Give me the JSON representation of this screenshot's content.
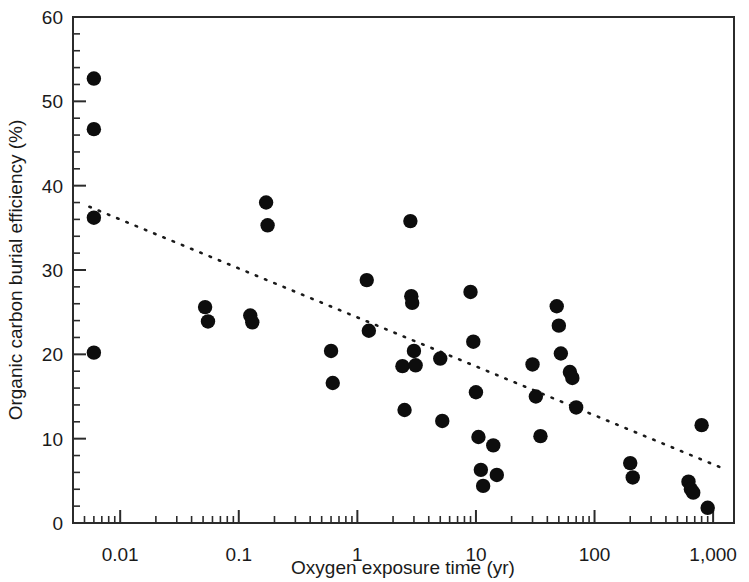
{
  "chart_data": {
    "type": "scatter",
    "title": "",
    "xlabel": "Oxygen exposure time (yr)",
    "ylabel": "Organic carbon burial efficiency (%)",
    "xscale": "log",
    "yscale": "linear",
    "xlim": [
      0.004,
      1500
    ],
    "ylim": [
      0,
      60
    ],
    "grid": false,
    "legend": null,
    "x_tick_labels": [
      "0.01",
      "0.1",
      "1",
      "10",
      "100",
      "1,000"
    ],
    "x_tick_values": [
      0.01,
      0.1,
      1,
      10,
      100,
      1000
    ],
    "y_tick_labels": [
      "0",
      "10",
      "20",
      "30",
      "40",
      "50",
      "60"
    ],
    "y_tick_values": [
      0,
      10,
      20,
      30,
      40,
      50,
      60
    ],
    "y_minor_step": 2,
    "marker": "filled-circle",
    "marker_color": "#0d0d0d",
    "series": [
      {
        "name": "Organic carbon burial efficiency vs oxygen exposure time",
        "points": [
          [
            0.006,
            52.7
          ],
          [
            0.006,
            46.7
          ],
          [
            0.006,
            36.2
          ],
          [
            0.006,
            20.2
          ],
          [
            0.052,
            25.6
          ],
          [
            0.055,
            23.9
          ],
          [
            0.125,
            24.6
          ],
          [
            0.13,
            23.8
          ],
          [
            0.17,
            38.0
          ],
          [
            0.175,
            35.3
          ],
          [
            0.6,
            20.4
          ],
          [
            0.62,
            16.6
          ],
          [
            1.2,
            28.8
          ],
          [
            1.25,
            22.8
          ],
          [
            2.4,
            18.6
          ],
          [
            2.5,
            13.4
          ],
          [
            2.8,
            35.8
          ],
          [
            2.85,
            26.9
          ],
          [
            2.9,
            26.1
          ],
          [
            3.0,
            20.4
          ],
          [
            3.1,
            18.7
          ],
          [
            5.0,
            19.5
          ],
          [
            5.2,
            12.1
          ],
          [
            9.0,
            27.4
          ],
          [
            9.5,
            21.5
          ],
          [
            10.0,
            15.5
          ],
          [
            10.5,
            10.2
          ],
          [
            11.0,
            6.3
          ],
          [
            11.5,
            4.4
          ],
          [
            14.0,
            9.2
          ],
          [
            15.0,
            5.7
          ],
          [
            30.0,
            18.8
          ],
          [
            32.0,
            15.0
          ],
          [
            35.0,
            10.3
          ],
          [
            48.0,
            25.7
          ],
          [
            50.0,
            23.4
          ],
          [
            52.0,
            20.1
          ],
          [
            62.0,
            17.9
          ],
          [
            65.0,
            17.2
          ],
          [
            70.0,
            13.7
          ],
          [
            200.0,
            7.1
          ],
          [
            210.0,
            5.4
          ],
          [
            620.0,
            4.9
          ],
          [
            650.0,
            4.0
          ],
          [
            680.0,
            3.6
          ],
          [
            800.0,
            11.6
          ],
          [
            900.0,
            1.8
          ]
        ]
      }
    ],
    "trendline": {
      "style": "dotted",
      "x_start": 0.0055,
      "y_start": 37.5,
      "x_end": 1200,
      "y_end": 6.5
    }
  },
  "axes": {
    "x_title": "Oxygen exposure time (yr)",
    "y_title": "Organic carbon burial efficiency (%)"
  }
}
